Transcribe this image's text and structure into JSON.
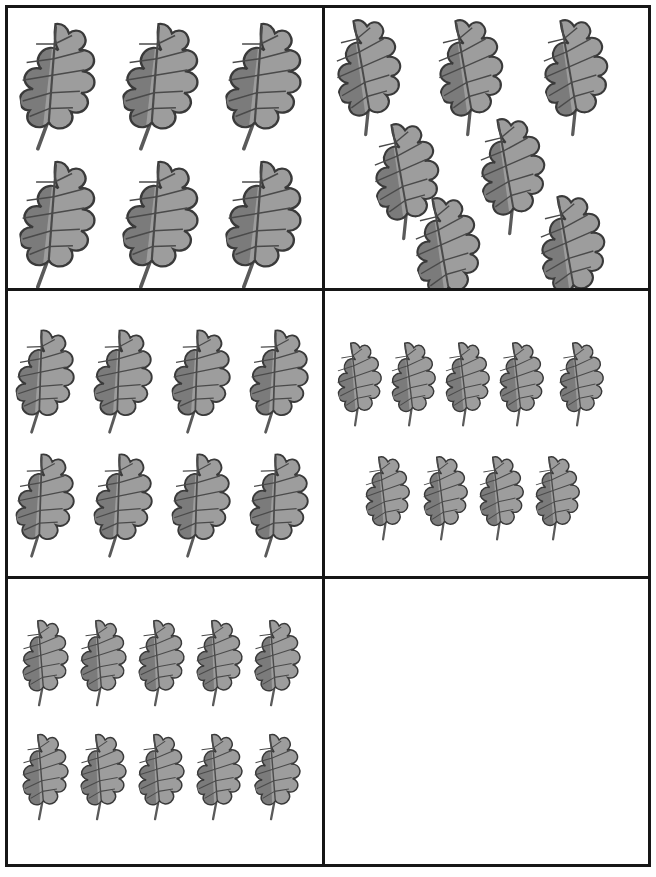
{
  "worksheet": {
    "title": "Counting leaves grid worksheet",
    "description": "Six bordered boxes arranged in a 2-column by 3-row grid; each box contains a group of oak leaf pictures to be counted. The last box is empty.",
    "grid": {
      "columns": 2,
      "rows": 3,
      "cell_count": 6
    },
    "style": {
      "page_background": "#ffffff",
      "border_color": "#161616",
      "border_width_px": 3,
      "leaf_dark_fill": "#7b7b7b",
      "leaf_light_fill": "#9d9d9d",
      "leaf_outline": "#3a3a3a",
      "leaf_vein": "#4a4a4a",
      "leaf_stem": "#5a5a5a"
    }
  },
  "chart_data": {
    "type": "table",
    "xlabel": "",
    "ylabel": "",
    "categories": [
      "Box 1",
      "Box 2",
      "Box 3",
      "Box 4",
      "Box 5",
      "Box 6"
    ],
    "values": [
      6,
      6,
      8,
      9,
      10,
      0
    ],
    "series": [
      {
        "name": "Leaf count per box",
        "values": [
          6,
          6,
          8,
          9,
          10,
          0
        ]
      }
    ]
  },
  "cells": [
    {
      "id": "cell-1",
      "position": "top-left",
      "count": 6,
      "count_label": "6",
      "arrangement": "3 columns x 2 rows",
      "icon": "oak-leaf-icon",
      "leaf_size": "large",
      "leaves": [
        {
          "x": 10,
          "y": 12,
          "w": 92,
          "h": 128,
          "rot": -8
        },
        {
          "x": 113,
          "y": 12,
          "w": 92,
          "h": 128,
          "rot": -8
        },
        {
          "x": 216,
          "y": 12,
          "w": 92,
          "h": 128,
          "rot": -8
        },
        {
          "x": 10,
          "y": 150,
          "w": 92,
          "h": 128,
          "rot": -8
        },
        {
          "x": 113,
          "y": 150,
          "w": 92,
          "h": 128,
          "rot": -8
        },
        {
          "x": 216,
          "y": 150,
          "w": 92,
          "h": 128,
          "rot": -8
        }
      ]
    },
    {
      "id": "cell-2",
      "position": "top-right",
      "count": 6,
      "count_label": "6",
      "arrangement": "scattered diagonal",
      "icon": "oak-leaf-icon",
      "leaf_size": "medium-large",
      "leaves": [
        {
          "x": 8,
          "y": 6,
          "w": 82,
          "h": 116,
          "rot": -22
        },
        {
          "x": 110,
          "y": 6,
          "w": 82,
          "h": 116,
          "rot": -22
        },
        {
          "x": 215,
          "y": 6,
          "w": 82,
          "h": 116,
          "rot": -22
        },
        {
          "x": 46,
          "y": 110,
          "w": 82,
          "h": 116,
          "rot": -22
        },
        {
          "x": 152,
          "y": 105,
          "w": 82,
          "h": 116,
          "rot": -22
        },
        {
          "x": 87,
          "y": 184,
          "w": 82,
          "h": 116,
          "rot": -22
        },
        {
          "x": 212,
          "y": 182,
          "w": 82,
          "h": 116,
          "rot": -22
        }
      ]
    },
    {
      "id": "cell-3",
      "position": "middle-left",
      "count": 8,
      "count_label": "8",
      "arrangement": "4 columns x 2 rows",
      "icon": "oak-leaf-icon",
      "leaf_size": "medium",
      "leaves": [
        {
          "x": 6,
          "y": 36,
          "w": 72,
          "h": 104,
          "rot": -10
        },
        {
          "x": 84,
          "y": 36,
          "w": 72,
          "h": 104,
          "rot": -10
        },
        {
          "x": 162,
          "y": 36,
          "w": 72,
          "h": 104,
          "rot": -10
        },
        {
          "x": 240,
          "y": 36,
          "w": 72,
          "h": 104,
          "rot": -10
        },
        {
          "x": 6,
          "y": 160,
          "w": 72,
          "h": 104,
          "rot": -10
        },
        {
          "x": 84,
          "y": 160,
          "w": 72,
          "h": 104,
          "rot": -10
        },
        {
          "x": 162,
          "y": 160,
          "w": 72,
          "h": 104,
          "rot": -10
        },
        {
          "x": 240,
          "y": 160,
          "w": 72,
          "h": 104,
          "rot": -10
        }
      ]
    },
    {
      "id": "cell-4",
      "position": "middle-right",
      "count": 9,
      "count_label": "9",
      "arrangement": "row of 5 above row of 4",
      "icon": "oak-leaf-icon",
      "leaf_size": "small",
      "leaves": [
        {
          "x": 10,
          "y": 48,
          "w": 56,
          "h": 84,
          "rot": -18
        },
        {
          "x": 64,
          "y": 48,
          "w": 56,
          "h": 84,
          "rot": -18
        },
        {
          "x": 118,
          "y": 48,
          "w": 56,
          "h": 84,
          "rot": -18
        },
        {
          "x": 172,
          "y": 48,
          "w": 56,
          "h": 84,
          "rot": -18
        },
        {
          "x": 232,
          "y": 48,
          "w": 56,
          "h": 84,
          "rot": -18
        },
        {
          "x": 38,
          "y": 162,
          "w": 56,
          "h": 84,
          "rot": -18
        },
        {
          "x": 96,
          "y": 162,
          "w": 56,
          "h": 84,
          "rot": -18
        },
        {
          "x": 152,
          "y": 162,
          "w": 56,
          "h": 84,
          "rot": -18
        },
        {
          "x": 208,
          "y": 162,
          "w": 56,
          "h": 84,
          "rot": -18
        }
      ]
    },
    {
      "id": "cell-5",
      "position": "bottom-left",
      "count": 10,
      "count_label": "10",
      "arrangement": "5 columns x 2 rows",
      "icon": "oak-leaf-icon",
      "leaf_size": "small",
      "leaves": [
        {
          "x": 12,
          "y": 38,
          "w": 58,
          "h": 86,
          "rot": -16
        },
        {
          "x": 70,
          "y": 38,
          "w": 58,
          "h": 86,
          "rot": -16
        },
        {
          "x": 128,
          "y": 38,
          "w": 58,
          "h": 86,
          "rot": -16
        },
        {
          "x": 186,
          "y": 38,
          "w": 58,
          "h": 86,
          "rot": -16
        },
        {
          "x": 244,
          "y": 38,
          "w": 58,
          "h": 86,
          "rot": -16
        },
        {
          "x": 12,
          "y": 152,
          "w": 58,
          "h": 86,
          "rot": -16
        },
        {
          "x": 70,
          "y": 152,
          "w": 58,
          "h": 86,
          "rot": -16
        },
        {
          "x": 128,
          "y": 152,
          "w": 58,
          "h": 86,
          "rot": -16
        },
        {
          "x": 186,
          "y": 152,
          "w": 58,
          "h": 86,
          "rot": -16
        },
        {
          "x": 244,
          "y": 152,
          "w": 58,
          "h": 86,
          "rot": -16
        }
      ]
    },
    {
      "id": "cell-6",
      "position": "bottom-right",
      "count": 0,
      "count_label": "0",
      "arrangement": "empty",
      "icon": "oak-leaf-icon",
      "leaf_size": "none",
      "leaves": []
    }
  ]
}
